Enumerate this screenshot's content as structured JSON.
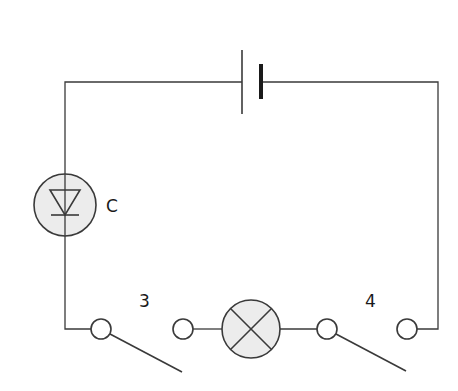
{
  "diagram": {
    "type": "circuit",
    "colors": {
      "line": "#3a3a3a",
      "component_fill": "#ececec",
      "background": "#ffffff"
    },
    "components": [
      {
        "id": "battery",
        "kind": "cell",
        "label": ""
      },
      {
        "id": "led",
        "kind": "light-emitting-diode",
        "label": "C"
      },
      {
        "id": "switch-3",
        "kind": "switch-open",
        "label": "3"
      },
      {
        "id": "lamp",
        "kind": "lamp",
        "label": ""
      },
      {
        "id": "switch-4",
        "kind": "switch-open",
        "label": "4"
      }
    ],
    "labels": {
      "led": "C",
      "switch_left": "3",
      "switch_right": "4"
    }
  }
}
